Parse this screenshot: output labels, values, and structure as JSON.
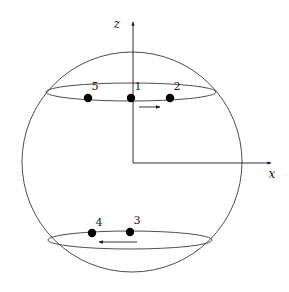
{
  "figure": {
    "title": "",
    "background_color": "#ffffff",
    "stroke_color": "#3a3a3a",
    "point_color": "#000000",
    "label_color": "#1a1a1a"
  },
  "axes": {
    "z": {
      "label": "z",
      "label_x": 117,
      "label_y": 28,
      "line_x": 133,
      "line_y_top": 22,
      "line_y_bottom": 163
    },
    "x": {
      "label": "x",
      "label_x": 272,
      "label_y": 178,
      "line_y": 163,
      "line_x_left": 133,
      "line_x_right": 271
    },
    "origin": {
      "x": 133,
      "y": 163
    }
  },
  "sphere": {
    "center_x": 132,
    "center_y": 162,
    "radius": 110
  },
  "cross_sections": [
    {
      "name": "upper-ring",
      "center_x": 131,
      "center_y": 92,
      "rx": 85,
      "ry": 9
    },
    {
      "name": "lower-ring",
      "center_x": 130,
      "center_y": 240,
      "rx": 82,
      "ry": 9
    }
  ],
  "points": [
    {
      "id": "5",
      "label": "5",
      "x": 88,
      "y": 98,
      "r": 4.2,
      "label_x": 95,
      "label_y": 89
    },
    {
      "id": "1",
      "label": "1",
      "x": 131,
      "y": 98,
      "r": 4.2,
      "label_x": 138,
      "label_y": 89
    },
    {
      "id": "2",
      "label": "2",
      "x": 170,
      "y": 98,
      "r": 4.2,
      "label_x": 177,
      "label_y": 89
    },
    {
      "id": "4",
      "label": "4",
      "x": 92,
      "y": 233,
      "r": 4.2,
      "label_x": 99,
      "label_y": 225
    },
    {
      "id": "3",
      "label": "3",
      "x": 130,
      "y": 232,
      "r": 4.2,
      "label_x": 137,
      "label_y": 223
    }
  ],
  "arrows": [
    {
      "name": "upper-velocity-arrow",
      "direction": "right",
      "x_start": 139,
      "x_end": 160,
      "y": 107
    },
    {
      "name": "lower-velocity-arrow",
      "direction": "left",
      "x_start": 137,
      "x_end": 99,
      "y": 242
    }
  ]
}
